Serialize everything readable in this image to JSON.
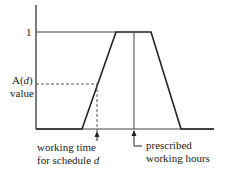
{
  "diagram": {
    "y_tick_one": "1",
    "a_label_fn": "A(",
    "a_label_var": "d",
    "a_label_close": ")",
    "a_label_value": "value",
    "working_time_line1": "working time",
    "working_time_line2_prefix": "for schedule ",
    "working_time_line2_var": "d",
    "prescribed_line1": "prescribed",
    "prescribed_line2": "working hours"
  },
  "colors": {
    "stroke": "#222222",
    "dashed": "#555555"
  }
}
